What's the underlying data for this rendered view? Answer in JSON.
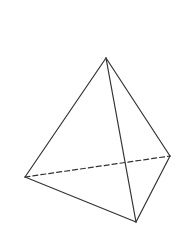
{
  "diagram": {
    "title": "",
    "shape": "tetrahedron",
    "stroke_color": "#333333",
    "background": "#ffffff",
    "vertices": {
      "top": [
        106,
        58
      ],
      "left": [
        25,
        177
      ],
      "bottom": [
        136,
        222
      ],
      "right": [
        170,
        156
      ]
    },
    "edges": [
      {
        "from": "top",
        "to": "left",
        "style": "solid"
      },
      {
        "from": "top",
        "to": "bottom",
        "style": "solid"
      },
      {
        "from": "top",
        "to": "right",
        "style": "solid"
      },
      {
        "from": "left",
        "to": "bottom",
        "style": "solid"
      },
      {
        "from": "bottom",
        "to": "right",
        "style": "solid"
      },
      {
        "from": "left",
        "to": "right",
        "style": "dashed"
      }
    ]
  }
}
